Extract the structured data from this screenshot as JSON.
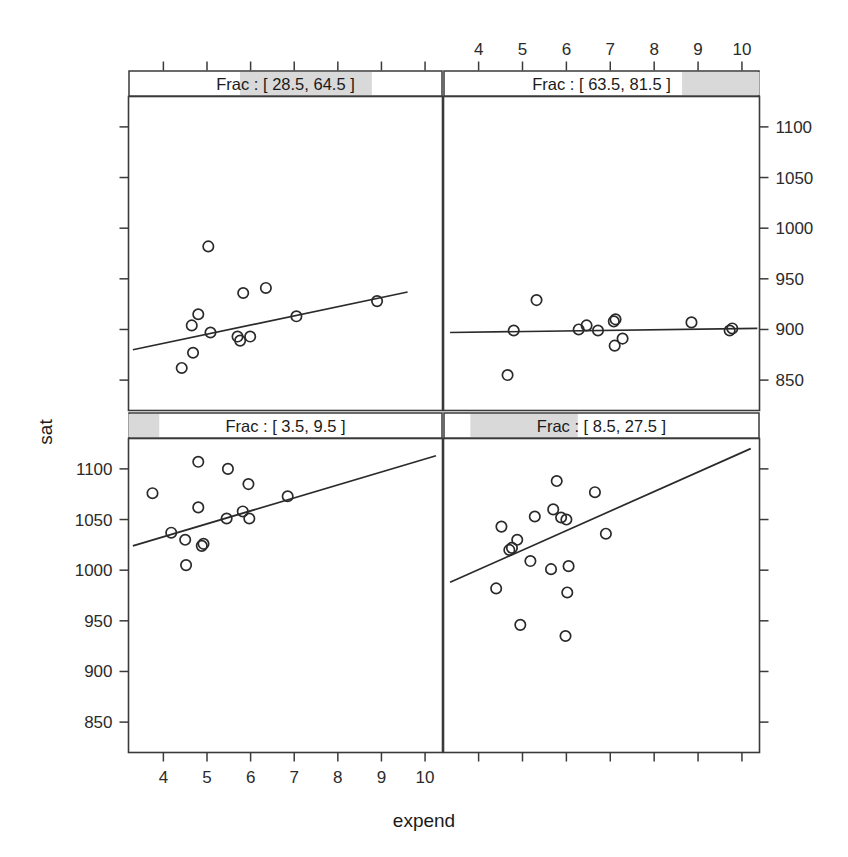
{
  "figure": {
    "type": "coplot",
    "xlabel": "expend",
    "ylabel": "sat"
  },
  "chart_data": {
    "type": "scatter",
    "title": "",
    "xlabel": "expend",
    "ylabel": "sat",
    "conditioning_variable": "Frac",
    "xlim": [
      3.2,
      10.4
    ],
    "ylim": [
      820,
      1130
    ],
    "xticks": [
      4,
      5,
      6,
      7,
      8,
      9,
      10
    ],
    "yticks": [
      850,
      900,
      950,
      1000,
      1050,
      1100
    ],
    "grid": false,
    "legend": "none",
    "panels": [
      {
        "position": "top-left",
        "strip_label": "Frac : [ 28.5, 64.5 ]",
        "strip_interval": [
          28.5,
          64.5
        ],
        "strip_shade_start_frac": 0.355,
        "strip_shade_end_frac": 0.775,
        "x_axis_side": "bottom-shared",
        "y_axis_side": "right",
        "points": [
          {
            "x": 5.03,
            "y": 982
          },
          {
            "x": 5.83,
            "y": 936
          },
          {
            "x": 6.35,
            "y": 941
          },
          {
            "x": 4.8,
            "y": 915
          },
          {
            "x": 4.65,
            "y": 904
          },
          {
            "x": 5.08,
            "y": 897
          },
          {
            "x": 5.7,
            "y": 893
          },
          {
            "x": 5.76,
            "y": 889
          },
          {
            "x": 5.99,
            "y": 893
          },
          {
            "x": 4.68,
            "y": 877
          },
          {
            "x": 4.42,
            "y": 862
          },
          {
            "x": 7.05,
            "y": 913
          },
          {
            "x": 8.9,
            "y": 928
          }
        ],
        "fit_line": {
          "x1": 3.3,
          "y1": 880,
          "x2": 9.6,
          "y2": 937
        }
      },
      {
        "position": "top-right",
        "strip_label": "Frac : [ 63.5, 81.5 ]",
        "strip_interval": [
          63.5,
          81.5
        ],
        "strip_shade_start_frac": 0.755,
        "strip_shade_end_frac": 1.0,
        "x_axis_side": "top",
        "y_axis_side": "right",
        "points": [
          {
            "x": 5.32,
            "y": 929
          },
          {
            "x": 4.8,
            "y": 899
          },
          {
            "x": 6.28,
            "y": 900
          },
          {
            "x": 6.46,
            "y": 904
          },
          {
            "x": 6.72,
            "y": 899
          },
          {
            "x": 7.08,
            "y": 908
          },
          {
            "x": 7.12,
            "y": 910
          },
          {
            "x": 7.28,
            "y": 891
          },
          {
            "x": 7.1,
            "y": 884
          },
          {
            "x": 8.85,
            "y": 907
          },
          {
            "x": 9.72,
            "y": 899
          },
          {
            "x": 9.78,
            "y": 901
          },
          {
            "x": 4.66,
            "y": 855
          }
        ],
        "fit_line": {
          "x1": 3.35,
          "y1": 897,
          "x2": 10.35,
          "y2": 901
        }
      },
      {
        "position": "bottom-left",
        "strip_label": "Frac : [ 3.5, 9.5 ]",
        "strip_interval": [
          3.5,
          9.5
        ],
        "strip_shade_start_frac": 0.0,
        "strip_shade_end_frac": 0.098,
        "x_axis_side": "bottom",
        "y_axis_side": "left",
        "points": [
          {
            "x": 4.8,
            "y": 1107
          },
          {
            "x": 5.48,
            "y": 1100
          },
          {
            "x": 3.75,
            "y": 1076
          },
          {
            "x": 5.95,
            "y": 1085
          },
          {
            "x": 6.85,
            "y": 1073
          },
          {
            "x": 4.8,
            "y": 1062
          },
          {
            "x": 5.82,
            "y": 1058
          },
          {
            "x": 5.45,
            "y": 1051
          },
          {
            "x": 5.97,
            "y": 1051
          },
          {
            "x": 4.18,
            "y": 1037
          },
          {
            "x": 4.5,
            "y": 1030
          },
          {
            "x": 4.88,
            "y": 1024
          },
          {
            "x": 4.92,
            "y": 1026
          },
          {
            "x": 4.52,
            "y": 1005
          }
        ],
        "fit_line": {
          "x1": 3.3,
          "y1": 1024,
          "x2": 10.25,
          "y2": 1113
        }
      },
      {
        "position": "bottom-right",
        "strip_label": "Frac : [ 8.5, 27.5 ]",
        "strip_interval": [
          8.5,
          27.5
        ],
        "strip_shade_start_frac": 0.085,
        "strip_shade_end_frac": 0.425,
        "x_axis_side": "bottom-shared",
        "y_axis_side": "right",
        "points": [
          {
            "x": 5.78,
            "y": 1088
          },
          {
            "x": 6.65,
            "y": 1077
          },
          {
            "x": 5.7,
            "y": 1060
          },
          {
            "x": 5.88,
            "y": 1052
          },
          {
            "x": 6.0,
            "y": 1050
          },
          {
            "x": 5.28,
            "y": 1053
          },
          {
            "x": 4.52,
            "y": 1043
          },
          {
            "x": 4.88,
            "y": 1030
          },
          {
            "x": 4.76,
            "y": 1022
          },
          {
            "x": 4.7,
            "y": 1020
          },
          {
            "x": 6.9,
            "y": 1036
          },
          {
            "x": 5.65,
            "y": 1001
          },
          {
            "x": 5.18,
            "y": 1009
          },
          {
            "x": 6.05,
            "y": 1004
          },
          {
            "x": 4.4,
            "y": 982
          },
          {
            "x": 6.02,
            "y": 978
          },
          {
            "x": 4.95,
            "y": 946
          },
          {
            "x": 5.98,
            "y": 935
          }
        ],
        "fit_line": {
          "x1": 3.35,
          "y1": 988,
          "x2": 10.2,
          "y2": 1120
        }
      }
    ]
  },
  "axes": {
    "bottom": {
      "label": "expend",
      "ticks": [
        "4",
        "5",
        "6",
        "7",
        "8",
        "9",
        "10"
      ]
    },
    "top": {
      "ticks": [
        "4",
        "5",
        "6",
        "7",
        "8",
        "9",
        "10"
      ]
    },
    "left": {
      "label": "sat",
      "ticks": [
        "1100",
        "1050",
        "1000",
        "950",
        "900",
        "850"
      ]
    },
    "right": {
      "ticks": [
        "1100",
        "1050",
        "1000",
        "950",
        "900",
        "850"
      ]
    }
  }
}
